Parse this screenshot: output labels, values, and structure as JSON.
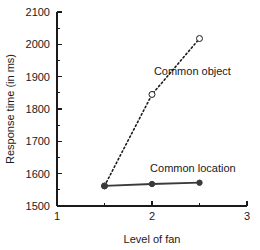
{
  "chart_data": {
    "type": "line",
    "title": "",
    "xlabel": "Level of fan",
    "ylabel": "Response time (in ms)",
    "xlim": [
      1,
      3
    ],
    "ylim": [
      1500,
      2100
    ],
    "grid": false,
    "legend_position": "inline-annotations",
    "x_ticks_major": [
      1,
      2,
      3
    ],
    "x_tick_labels": [
      "1",
      "2",
      "3"
    ],
    "x_ticks_minor": [
      1.5,
      2.5
    ],
    "y_ticks_major": [
      1500,
      1600,
      1700,
      1800,
      1900,
      2000,
      2100
    ],
    "y_tick_labels": [
      "1500",
      "1600",
      "1700",
      "1800",
      "1900",
      "2000",
      "2100"
    ],
    "y_ticks_minor": [
      1550,
      1650,
      1750,
      1850,
      1950,
      2050
    ],
    "x": [
      1.5,
      2,
      2.5
    ],
    "series": [
      {
        "name": "Common object",
        "label": "Common object",
        "values": [
          1562,
          1845,
          2018
        ],
        "line_style": "dashed",
        "marker": "open-circle",
        "color": "#1a1a1a",
        "label_x": 2.02,
        "label_y": 1905
      },
      {
        "name": "Common location",
        "label": "Common location",
        "values": [
          1562,
          1568,
          1572
        ],
        "line_style": "solid",
        "marker": "filled-circle",
        "color": "#3a3a3a",
        "label_x": 1.98,
        "label_y": 1605
      }
    ]
  }
}
